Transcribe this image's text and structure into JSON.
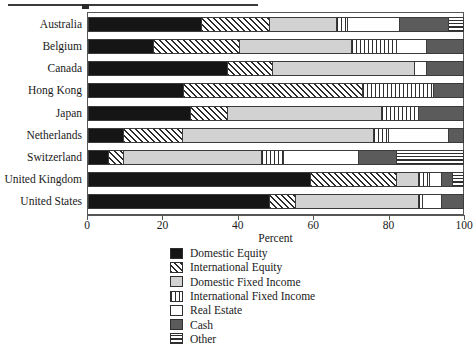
{
  "chart_data": {
    "type": "bar",
    "orientation": "horizontal",
    "stacked": true,
    "title": "",
    "xlabel": "Percent",
    "ylabel": "",
    "xlim": [
      0,
      100
    ],
    "xticks": [
      0,
      20,
      40,
      60,
      80,
      100
    ],
    "grid": false,
    "legend_position": "bottom",
    "categories": [
      "Australia",
      "Belgium",
      "Canada",
      "Hong Kong",
      "Japan",
      "Netherlands",
      "Switzerland",
      "United Kingdom",
      "United States"
    ],
    "series": [
      {
        "name": "Domestic Equity",
        "pattern": "solid-black",
        "color": "#151515",
        "values": [
          30,
          17,
          37,
          25,
          27,
          9,
          5,
          59,
          48
        ]
      },
      {
        "name": "International Equity",
        "pattern": "diagonal-hatch",
        "color": "#ffffff",
        "values": [
          18,
          23,
          12,
          48,
          10,
          16,
          4,
          23,
          7
        ]
      },
      {
        "name": "Domestic Fixed Income",
        "pattern": "light-gray",
        "color": "#d2d2d2",
        "values": [
          18,
          30,
          38,
          0,
          41,
          51,
          37,
          6,
          33
        ]
      },
      {
        "name": "International Fixed Income",
        "pattern": "vertical-stripes",
        "color": "#e8e8e8",
        "values": [
          3,
          12,
          0,
          19,
          10,
          4,
          6,
          3,
          1
        ]
      },
      {
        "name": "Real Estate",
        "pattern": "white",
        "color": "#ffffff",
        "values": [
          14,
          8,
          3,
          0,
          0,
          16,
          20,
          3,
          5
        ]
      },
      {
        "name": "Cash",
        "pattern": "dark-gray",
        "color": "#5b5b5b",
        "values": [
          13,
          10,
          10,
          8,
          12,
          4,
          10,
          3,
          6
        ]
      },
      {
        "name": "Other",
        "pattern": "horizontal-stripes",
        "color": "#ffffff",
        "values": [
          4,
          0,
          0,
          0,
          0,
          0,
          18,
          3,
          0
        ]
      }
    ]
  },
  "axis": {
    "x_title": "Percent",
    "tick_labels": [
      "0",
      "20",
      "40",
      "60",
      "80",
      "100"
    ]
  },
  "legend": {
    "items": [
      {
        "label": "Domestic Equity",
        "pattern_class": "p-domestic-equity",
        "icon": "swatch-solid-black"
      },
      {
        "label": "International Equity",
        "pattern_class": "p-international-equity",
        "icon": "swatch-diagonal-hatch"
      },
      {
        "label": "Domestic Fixed Income",
        "pattern_class": "p-domestic-fixed-income",
        "icon": "swatch-light-gray"
      },
      {
        "label": "International Fixed Income",
        "pattern_class": "p-international-fixed-income",
        "icon": "swatch-vertical-stripes"
      },
      {
        "label": "Real Estate",
        "pattern_class": "p-real-estate",
        "icon": "swatch-white"
      },
      {
        "label": "Cash",
        "pattern_class": "p-cash",
        "icon": "swatch-dark-gray"
      },
      {
        "label": "Other",
        "pattern_class": "p-other",
        "icon": "swatch-horizontal-stripes"
      }
    ]
  }
}
